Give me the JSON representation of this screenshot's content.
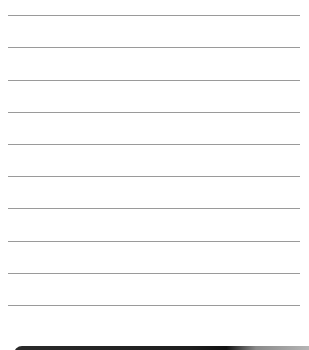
{
  "notepad": {
    "lines": [
      {
        "y": 15
      },
      {
        "y": 47
      },
      {
        "y": 80
      },
      {
        "y": 112
      },
      {
        "y": 144
      },
      {
        "y": 176
      },
      {
        "y": 208
      },
      {
        "y": 241
      },
      {
        "y": 273
      },
      {
        "y": 305
      }
    ],
    "line_color": "#9a9a9a",
    "background_color": "#ffffff"
  },
  "bottom_bar": {
    "color": "#1e1e1e"
  }
}
